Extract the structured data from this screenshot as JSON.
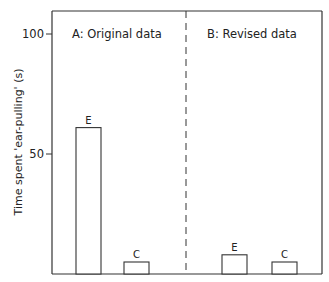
{
  "chart_data": {
    "type": "bar",
    "title": "",
    "ylabel": "Time spent 'ear-pulling' (s)",
    "xlabel": "",
    "ylim": [
      0,
      110
    ],
    "yticks": [
      50,
      100
    ],
    "grid": false,
    "panels": [
      {
        "label": "A: Original data",
        "categories": [
          "E",
          "C"
        ],
        "values": [
          61,
          5
        ]
      },
      {
        "label": "B: Revised data",
        "categories": [
          "E",
          "C"
        ],
        "values": [
          8,
          5
        ]
      }
    ],
    "separator": "dashed vertical line between panels"
  },
  "colors": {
    "axis": "#333333",
    "bar_fill": "#ffffff",
    "bar_stroke": "#333333",
    "text": "#222222"
  }
}
